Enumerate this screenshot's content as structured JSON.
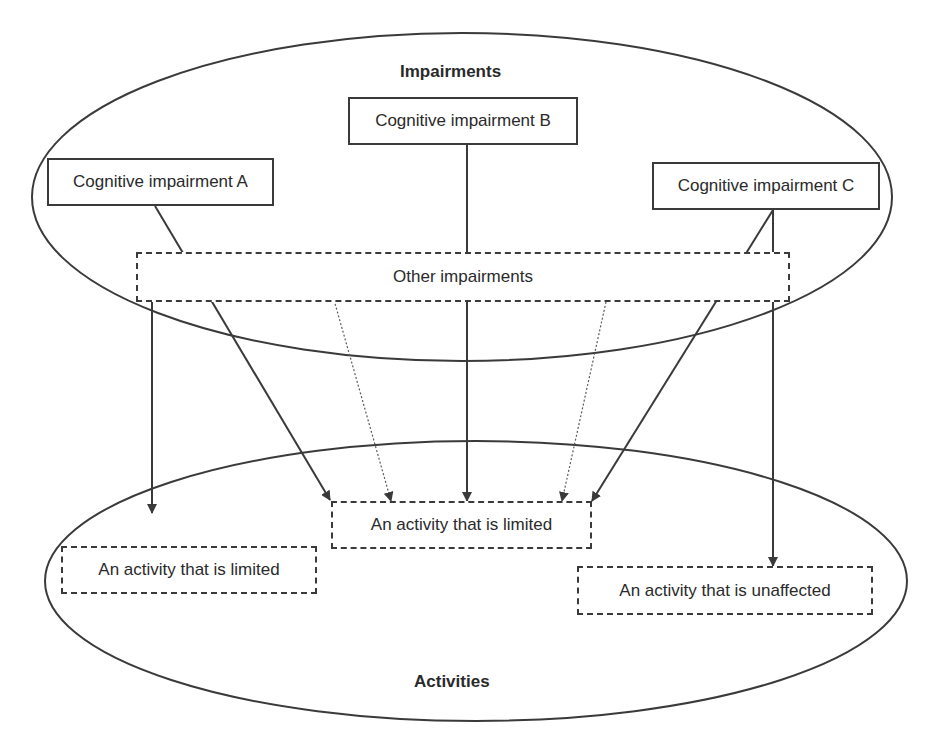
{
  "diagram": {
    "groups": {
      "impairments": {
        "title": "Impairments"
      },
      "activities": {
        "title": "Activities"
      }
    },
    "impairment_boxes": [
      {
        "label": "Cognitive impairment A",
        "style": "solid"
      },
      {
        "label": "Cognitive impairment B",
        "style": "solid"
      },
      {
        "label": "Cognitive impairment C",
        "style": "solid"
      },
      {
        "label": "Other impairments",
        "style": "dashed"
      }
    ],
    "activity_boxes": [
      {
        "label": "An activity that is limited",
        "style": "dashed",
        "position": "left"
      },
      {
        "label": "An activity that is limited",
        "style": "dashed",
        "position": "center"
      },
      {
        "label": "An activity that is unaffected",
        "style": "dashed",
        "position": "right"
      }
    ],
    "edges": [
      {
        "from": "Other impairments",
        "to": "An activity that is limited (left)",
        "style": "solid"
      },
      {
        "from": "Cognitive impairment A",
        "to": "An activity that is limited (center)",
        "style": "solid"
      },
      {
        "from": "Other impairments",
        "to": "An activity that is limited (center)",
        "style": "dotted"
      },
      {
        "from": "Cognitive impairment B",
        "to": "An activity that is limited (center)",
        "style": "solid"
      },
      {
        "from": "Other impairments",
        "to": "An activity that is limited (center)",
        "style": "dotted"
      },
      {
        "from": "Cognitive impairment C",
        "to": "An activity that is limited (center)",
        "style": "solid"
      },
      {
        "from": "Cognitive impairment C",
        "to": "An activity that is unaffected",
        "style": "solid"
      }
    ],
    "colors": {
      "stroke": "#3a3a3a",
      "text": "#2a2a2a",
      "background": "#ffffff"
    }
  }
}
